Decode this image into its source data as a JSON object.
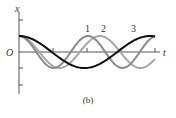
{
  "chart_data": {
    "type": "line",
    "title": "",
    "caption": "(b)",
    "xlabel": "t",
    "ylabel": "x",
    "origin_label": "O",
    "grid": false,
    "legend": "inline numeric labels above curves",
    "x_ticks": 4,
    "y_ticks_above": 1,
    "y_ticks_below": 2,
    "series": [
      {
        "name": "1",
        "label": "1",
        "color": "#8a8a8a",
        "amplitude": 1.0,
        "period_px": 69,
        "phase": 0,
        "note": "cosine, shortest period"
      },
      {
        "name": "2",
        "label": "2",
        "color": "#a8a8a8",
        "amplitude": 1.0,
        "period_px": 81,
        "phase": 0,
        "note": "cosine, medium period"
      },
      {
        "name": "3",
        "label": "3",
        "color": "#111111",
        "amplitude": 1.0,
        "period_px": 131,
        "phase": 0,
        "note": "cosine, longest period"
      }
    ]
  },
  "labels": {
    "x_axis": "x",
    "t_axis": "t",
    "origin": "O",
    "curve1": "1",
    "curve2": "2",
    "curve3": "3",
    "caption": "(b)"
  },
  "layout": {
    "x0": 19,
    "x1": 155,
    "axis_y": 52,
    "amp_px": 16
  }
}
